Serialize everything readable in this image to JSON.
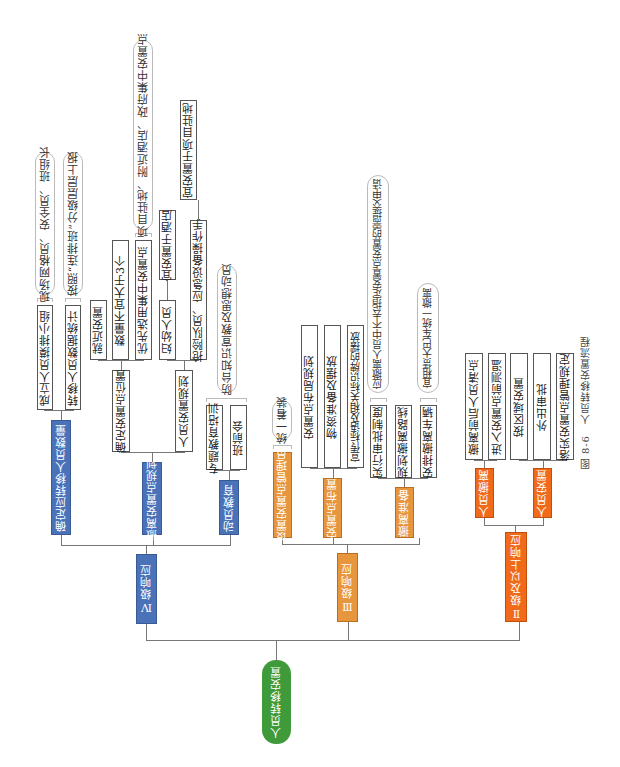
{
  "root": {
    "label": "人员转移安置",
    "color": "#3f9a3a"
  },
  "levels": [
    {
      "label": "Ⅳ级响应",
      "color": "#4a72b8",
      "children": [
        {
          "label": "确定应转移人员数量",
          "items": [
            {
              "label": "成立人员摸排小组",
              "note": "现场网格员、安全员、班组长"
            },
            {
              "label": "转移人员数据统计",
              "note": "按照“连排班”分级层层上报"
            }
          ]
        },
        {
          "label": "撤离安置点规划",
          "items": [
            {
              "label": "确定安置点位置",
              "sub": [
                {
                  "label": "就近安置"
                },
                {
                  "label": "数量不宜大于3个"
                },
                {
                  "label": "优先选用集中安置点",
                  "note": "项目驻地、附近酒店、政府集中安置点"
                }
              ]
            },
            {
              "label": "人员安置规划",
              "sub": [
                {
                  "label": "妇幼人员",
                  "sub": [
                    {
                      "label": "宜安置于酒店"
                    }
                  ]
                },
                {
                  "label": "抢险队员、应急设备操作手",
                  "sub": [
                    {
                      "label": "宜安置于项目驻地"
                    }
                  ]
                }
              ]
            }
          ]
        },
        {
          "label": "动员教育",
          "items": [
            {
              "label": "专题教育培训"
            },
            {
              "label": "班前会"
            }
          ],
          "note": "防台知识宣教及思想动员"
        }
      ]
    },
    {
      "label": "Ⅲ级响应",
      "color": "#e8963e",
      "children": [
        {
          "label": "设置安置点管理员",
          "note": "统一着装"
        },
        {
          "label": "安置点布置",
          "items": [
            {
              "label": "安置点布局规划"
            },
            {
              "label": "物资准备及摆放"
            },
            {
              "label": "宣传标语及相关标识牌的摆放"
            }
          ]
        },
        {
          "label": "撤离准备",
          "items": [
            {
              "label": "实行审批制度",
              "note": "应撤离人员中不去指定安置点安置的需提交申请"
            },
            {
              "label": "规划撤离路线"
            },
            {
              "label": "安排撤离车辆",
              "note": "宜租赁大巴车统一撤离"
            }
          ]
        }
      ]
    },
    {
      "label": "Ⅱ级及以上响应",
      "color": "#f06a1a",
      "children": [
        {
          "label": "人员撤离",
          "items": [
            {
              "label": "撤离前后人员清点"
            },
            {
              "label": "进入安置点前测温"
            }
          ]
        },
        {
          "label": "人员安置",
          "items": [
            {
              "label": "按区域安置"
            },
            {
              "label": "外出审批"
            },
            {
              "label": "落实安置点管理规定"
            }
          ]
        }
      ]
    }
  ],
  "caption": "图 8-6　人员转移安置流程"
}
